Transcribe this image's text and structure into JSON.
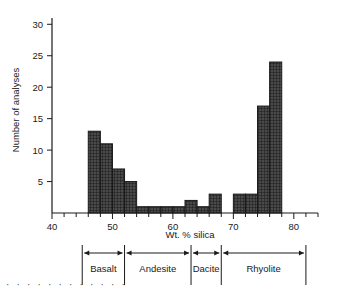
{
  "chart_data": {
    "type": "bar",
    "title": "",
    "xlabel": "Wt. % silica",
    "ylabel": "Number of analyses",
    "xlim": [
      40,
      84
    ],
    "ylim": [
      0,
      31
    ],
    "xticks": [
      40,
      50,
      60,
      70,
      80
    ],
    "xtick_labels": [
      "40",
      "50",
      "60",
      "70",
      "80"
    ],
    "xminor_step": 2,
    "yticks": [
      5,
      10,
      15,
      20,
      25,
      30
    ],
    "ytick_labels": [
      "5",
      "10",
      "15",
      "20",
      "25",
      "30"
    ],
    "grid": false,
    "legend": "none",
    "bin_width": 2,
    "bins": [
      {
        "x0": 46,
        "x1": 48,
        "value": 13
      },
      {
        "x0": 48,
        "x1": 50,
        "value": 11
      },
      {
        "x0": 50,
        "x1": 52,
        "value": 7
      },
      {
        "x0": 52,
        "x1": 54,
        "value": 5
      },
      {
        "x0": 54,
        "x1": 56,
        "value": 1
      },
      {
        "x0": 56,
        "x1": 58,
        "value": 1
      },
      {
        "x0": 58,
        "x1": 60,
        "value": 1
      },
      {
        "x0": 60,
        "x1": 62,
        "value": 1
      },
      {
        "x0": 62,
        "x1": 64,
        "value": 2
      },
      {
        "x0": 64,
        "x1": 66,
        "value": 1
      },
      {
        "x0": 66,
        "x1": 68,
        "value": 3
      },
      {
        "x0": 70,
        "x1": 72,
        "value": 3
      },
      {
        "x0": 72,
        "x1": 74,
        "value": 3
      },
      {
        "x0": 74,
        "x1": 76,
        "value": 17
      },
      {
        "x0": 76,
        "x1": 78,
        "value": 24
      }
    ],
    "categories": [
      {
        "label": "Basalt",
        "x0": 45,
        "x1": 52
      },
      {
        "label": "Andesite",
        "x0": 52,
        "x1": 63
      },
      {
        "label": "Dacite",
        "x0": 63,
        "x1": 68
      },
      {
        "label": "Rhyolite",
        "x0": 68,
        "x1": 82
      }
    ],
    "colors": {
      "bar_fill": "#4a4a4a",
      "bar_edge": "#1a1a1a",
      "axis": "#1a1a1a",
      "background": "#ffffff"
    }
  },
  "decoration": {
    "dots": "· · · · · · · · · · · ·"
  }
}
